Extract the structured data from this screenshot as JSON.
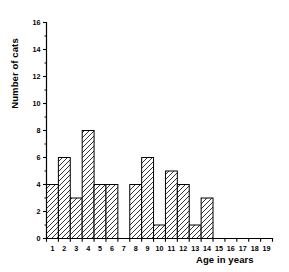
{
  "chart_data": {
    "type": "bar",
    "title": "",
    "xlabel": "Age in years",
    "ylabel": "Number of cats",
    "categories": [
      1,
      2,
      3,
      4,
      5,
      6,
      7,
      8,
      9,
      10,
      11,
      12,
      13,
      14,
      15,
      16,
      17,
      18,
      19
    ],
    "values": [
      4,
      6,
      3,
      8,
      4,
      4,
      0,
      4,
      6,
      1,
      5,
      4,
      1,
      3,
      0,
      0,
      0,
      0,
      0
    ],
    "xtick_labels": [
      "1",
      "2",
      "3",
      "4",
      "5",
      "6",
      "7",
      "8",
      "9",
      "10",
      "11",
      "12",
      "13",
      "14",
      "15",
      "16",
      "17",
      "18",
      "19"
    ],
    "ytick_labels": [
      "0",
      "2",
      "4",
      "6",
      "8",
      "10",
      "12",
      "14",
      "16"
    ],
    "ytick_values": [
      0,
      2,
      4,
      6,
      8,
      10,
      12,
      14,
      16
    ],
    "ylim": [
      0,
      16
    ],
    "xlim": [
      0.5,
      19.5
    ],
    "grid": false,
    "legend": null,
    "bar_fill": "#ffffff",
    "bar_edge": "#000000",
    "bar_hatch": "forward-diagonal",
    "axis_color": "#000000",
    "minor_ticks": true
  }
}
